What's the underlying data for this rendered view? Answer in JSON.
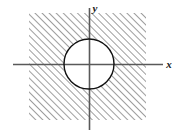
{
  "figure": {
    "background_color": "#ffffff",
    "width": 184,
    "height": 135
  },
  "axes": {
    "x_label": "x",
    "y_label": "y",
    "axis_color": "#595959",
    "origin": {
      "x": 89,
      "y": 64
    },
    "x_axis": {
      "start_x": 13,
      "end_x": 163,
      "y": 64
    },
    "y_axis": {
      "x": 89,
      "start_y": 8,
      "end_y": 130
    }
  },
  "region": {
    "name": "hatched-square",
    "left": 29,
    "top": 13,
    "right": 146,
    "bottom": 120,
    "hatch_color": "#4d4d4d",
    "hatch_spacing": 5,
    "hatch_angle_deg": 45,
    "fill": "none"
  },
  "circle": {
    "name": "unshaded-circle",
    "center_x": 89,
    "center_y": 64,
    "radius": 25,
    "stroke_color": "#111111",
    "fill_color": "#ffffff",
    "stroke_width": 1.4
  }
}
